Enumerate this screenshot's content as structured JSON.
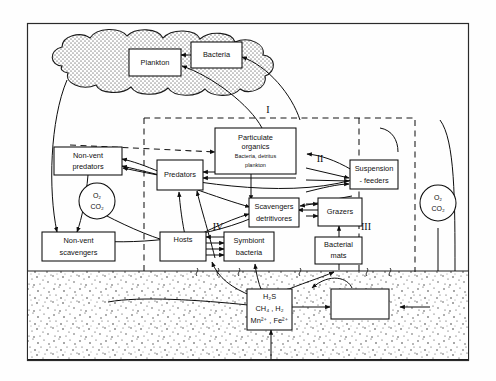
{
  "figure": {
    "type": "diagram",
    "canvas": {
      "width": 496,
      "height": 381
    }
  },
  "nodes": {
    "plankton": {
      "label": "Plankton"
    },
    "bacteria": {
      "label": "Bacteria"
    },
    "particulate": {
      "label_line1": "Particulate",
      "label_line2": "organics",
      "sub_line1": "Bacteria, detritus",
      "sub_line2": "plankton"
    },
    "nonvent_pred": {
      "label_line1": "Non-vent",
      "label_line2": "predators"
    },
    "nonvent_scav": {
      "label_line1": "Non-vent",
      "label_line2": "scavengers"
    },
    "predators": {
      "label": "Predators"
    },
    "scavengers": {
      "label_line1": "Scavengers",
      "label_line2": "detritivores"
    },
    "suspension": {
      "label_line1": "Suspension",
      "label_line2": "- feeders"
    },
    "grazers": {
      "label": "Grazers"
    },
    "bacterial_mats": {
      "label_line1": "Bacterial",
      "label_line2": "mats"
    },
    "hosts": {
      "label": "Hosts"
    },
    "symbiont": {
      "label_line1": "Symbiont",
      "label_line2": "bacteria"
    },
    "subsurface": {
      "label_line1": "Subsurface",
      "label_line2": "bacteria"
    },
    "chemicals": {
      "line1": "H₂S",
      "line2": "CH₄ , H₂",
      "line3": "Mn²⁺ , Fe²⁺"
    },
    "gas_left": {
      "line1": "O₂",
      "line2": "CO₂"
    },
    "gas_right": {
      "line1": "O₂",
      "line2": "CO₂"
    }
  },
  "annotations": {
    "roman_1": "I",
    "roman_2": "II",
    "roman_3": "III",
    "roman_4": "IV"
  },
  "colors": {
    "ink": "#0d0d0d",
    "frame": "#2a2a2a",
    "cloud_fill": "#d6d6d6",
    "sediment_fill": "#e8e8e8",
    "background": "#fefefe"
  }
}
